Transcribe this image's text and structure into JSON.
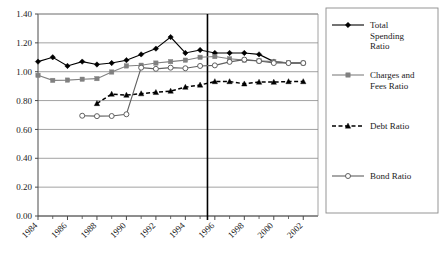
{
  "chart_data": {
    "type": "line",
    "title": "",
    "subtitle": "",
    "xlabel": "",
    "ylabel": "",
    "xlim": [
      1984,
      2003
    ],
    "ylim": [
      0.0,
      1.4
    ],
    "ytick_labels": [
      "0.00",
      "0.20",
      "0.40",
      "0.60",
      "0.80",
      "1.00",
      "1.20",
      "1.40"
    ],
    "ytick_values": [
      0.0,
      0.2,
      0.4,
      0.6,
      0.8,
      1.0,
      1.2,
      1.4
    ],
    "xtick_labels": [
      "1984",
      "1986",
      "1988",
      "1990",
      "1992",
      "1994",
      "1996",
      "1998",
      "2000",
      "2002"
    ],
    "xtick_values": [
      1984,
      1986,
      1988,
      1990,
      1992,
      1994,
      1996,
      1998,
      2000,
      2002
    ],
    "xtick_minor": [
      1985,
      1987,
      1989,
      1991,
      1993,
      1995,
      1997,
      1999,
      2001
    ],
    "grid": "horizontal",
    "legend_position": "right",
    "annotations": [
      {
        "type": "vertical-line",
        "x": 1995.5,
        "label": ""
      }
    ],
    "series": [
      {
        "name": "Total Spending Ratio",
        "marker": "filled-diamond",
        "line": "solid",
        "color": "#000000",
        "x": [
          1984,
          1985,
          1986,
          1987,
          1988,
          1989,
          1990,
          1991,
          1992,
          1993,
          1994,
          1995,
          1996,
          1997,
          1998,
          1999,
          2000,
          2001,
          2002
        ],
        "values": [
          1.07,
          1.1,
          1.04,
          1.07,
          1.05,
          1.06,
          1.08,
          1.12,
          1.16,
          1.24,
          1.13,
          1.15,
          1.13,
          1.13,
          1.13,
          1.12,
          1.07,
          1.06,
          1.06
        ]
      },
      {
        "name": "Charges and Fees Ratio",
        "marker": "filled-square",
        "line": "solid",
        "color": "#808080",
        "x": [
          1984,
          1985,
          1986,
          1987,
          1988,
          1989,
          1990,
          1991,
          1992,
          1993,
          1994,
          1995,
          1996,
          1997,
          1998,
          1999,
          2000,
          2001,
          2002
        ],
        "values": [
          0.975,
          0.94,
          0.942,
          0.948,
          0.952,
          0.998,
          1.04,
          1.045,
          1.06,
          1.07,
          1.08,
          1.1,
          1.105,
          1.09,
          1.08,
          1.075,
          1.07,
          1.062,
          1.06
        ]
      },
      {
        "name": "Debt Ratio",
        "marker": "filled-triangle",
        "line": "dashed",
        "color": "#000000",
        "x": [
          1988,
          1989,
          1990,
          1991,
          1992,
          1993,
          1994,
          1995,
          1996,
          1997,
          1998,
          1999,
          2000,
          2001,
          2002
        ],
        "values": [
          0.78,
          0.845,
          0.838,
          0.848,
          0.857,
          0.866,
          0.893,
          0.908,
          0.932,
          0.932,
          0.916,
          0.928,
          0.928,
          0.932,
          0.932
        ]
      },
      {
        "name": "Bond Ratio",
        "marker": "open-circle",
        "line": "solid",
        "color": "#606060",
        "x": [
          1987,
          1988,
          1989,
          1990,
          1991,
          1992,
          1993,
          1994,
          1995,
          1996,
          1997,
          1998,
          1999,
          2000,
          2001,
          2002
        ],
        "values": [
          0.695,
          0.692,
          0.693,
          0.705,
          1.028,
          1.02,
          1.028,
          1.024,
          1.04,
          1.044,
          1.068,
          1.084,
          1.074,
          1.06,
          1.06,
          1.06
        ]
      }
    ]
  },
  "legend": {
    "items": [
      {
        "label": "Total Spending Ratio",
        "lines": [
          "Total",
          "Spending",
          "Ratio"
        ],
        "marker": "filled-diamond",
        "line": "solid",
        "color": "#000000"
      },
      {
        "label": "Charges and Fees Ratio",
        "lines": [
          "Charges and",
          "Fees Ratio"
        ],
        "marker": "filled-square",
        "line": "solid",
        "color": "#808080"
      },
      {
        "label": "Debt Ratio",
        "lines": [
          "Debt Ratio"
        ],
        "marker": "filled-triangle",
        "line": "dashed",
        "color": "#000000"
      },
      {
        "label": "Bond Ratio",
        "lines": [
          "Bond Ratio"
        ],
        "marker": "open-circle",
        "line": "solid",
        "color": "#606060"
      }
    ]
  }
}
